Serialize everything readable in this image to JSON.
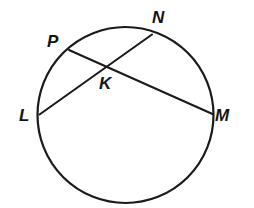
{
  "figure": {
    "kind": "circle-with-two-intersecting-chords",
    "background_color": "#ffffff",
    "stroke_color": "#1a1a1a",
    "label_color": "#141414",
    "circle": {
      "center_x": 125.5,
      "center_y": 115,
      "radius": 88,
      "stroke_width": 2.2
    },
    "chords": [
      {
        "name": "chord-PM",
        "from": "P",
        "to": "M",
        "x1": 69,
        "y1": 50,
        "x2": 212.5,
        "y2": 114,
        "stroke_width": 2.1
      },
      {
        "name": "chord-LN",
        "from": "L",
        "to": "N",
        "x1": 39.5,
        "y1": 114.5,
        "x2": 152,
        "y2": 34.5,
        "stroke_width": 2.1
      }
    ],
    "points": [
      {
        "id": "P",
        "label": "P",
        "x": 69,
        "y": 50,
        "on": "circle"
      },
      {
        "id": "N",
        "label": "N",
        "x": 152,
        "y": 34.5,
        "on": "circle"
      },
      {
        "id": "K",
        "label": "K",
        "x": 106.5,
        "y": 70,
        "on": "intersection"
      },
      {
        "id": "L",
        "label": "L",
        "x": 39.5,
        "y": 114.5,
        "on": "circle"
      },
      {
        "id": "M",
        "label": "M",
        "x": 212.5,
        "y": 114,
        "on": "circle"
      }
    ],
    "labels": {
      "P": "P",
      "N": "N",
      "K": "K",
      "L": "L",
      "M": "M"
    }
  }
}
